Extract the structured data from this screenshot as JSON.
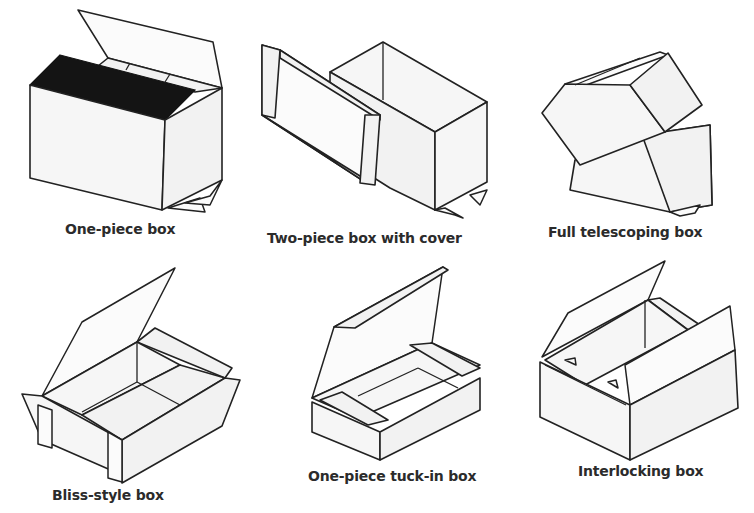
{
  "figure": {
    "type": "diagram",
    "items": [
      {
        "id": "one-piece-box",
        "label": "One-piece box"
      },
      {
        "id": "two-piece-box-with-cover",
        "label": "Two-piece box with cover"
      },
      {
        "id": "full-telescoping-box",
        "label": "Full telescoping box"
      },
      {
        "id": "bliss-style-box",
        "label": "Bliss-style box"
      },
      {
        "id": "one-piece-tuck-in-box",
        "label": "One-piece tuck-in box"
      },
      {
        "id": "interlocking-box",
        "label": "Interlocking box"
      }
    ]
  }
}
